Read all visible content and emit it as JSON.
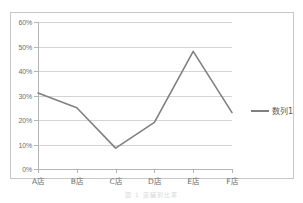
{
  "chart_data": {
    "type": "line",
    "title": "",
    "xlabel": "",
    "ylabel": "",
    "categories": [
      "A店",
      "B店",
      "C店",
      "D店",
      "E店",
      "F店"
    ],
    "series": [
      {
        "name": "数列1",
        "values": [
          31,
          25,
          8.5,
          19,
          48,
          23
        ],
        "color": "#808080"
      }
    ],
    "ylim": [
      0,
      60
    ],
    "ytick_values": [
      0,
      10,
      20,
      30,
      40,
      50,
      60
    ],
    "ytick_labels": [
      "0%",
      "10%",
      "20%",
      "30%",
      "40%",
      "50%",
      "60%"
    ],
    "value_format": "percent",
    "grid": true,
    "grid_axis": "y",
    "legend": true,
    "legend_position": "right",
    "markers": false
  },
  "legend": {
    "entry_label": "数列1"
  },
  "caption": {
    "text": "図 1  店舗別比率"
  },
  "colors": {
    "series_line": "#808080",
    "gridline": "#d4d4d4",
    "axis": "#b5b5b5",
    "frame_border": "#c9c9c9",
    "tick_label": "#6d6d6d",
    "plot_background": "#ffffff"
  }
}
